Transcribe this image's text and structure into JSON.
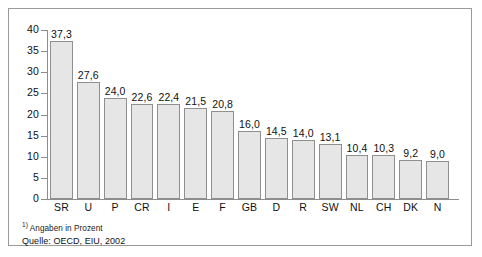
{
  "chart_data": {
    "type": "bar",
    "title": "",
    "xlabel": "",
    "ylabel": "",
    "ylim": [
      0,
      40
    ],
    "ytick_values": [
      40,
      35,
      30,
      25,
      20,
      15,
      10,
      5,
      0
    ],
    "ytick_labels": [
      "40",
      "35",
      "30",
      "25",
      "20",
      "15",
      "10",
      "5",
      "0"
    ],
    "grid": false,
    "legend": "none",
    "categories": [
      "SR",
      "U",
      "P",
      "CR",
      "I",
      "E",
      "F",
      "GB",
      "D",
      "R",
      "SW",
      "NL",
      "CH",
      "DK",
      "N"
    ],
    "values": [
      37.3,
      27.6,
      24.0,
      22.6,
      22.4,
      21.5,
      20.8,
      16.0,
      14.5,
      14.0,
      13.1,
      10.4,
      10.3,
      9.2,
      9.0
    ],
    "value_labels": [
      "37,3",
      "27,6",
      "24,0",
      "22,6",
      "22,4",
      "21,5",
      "20,8",
      "16,0",
      "14,5",
      "14,0",
      "13,1",
      "10,4",
      "10,3",
      "9,2",
      "9,0"
    ],
    "bar_fill_color": "#e6e6e6",
    "bar_border_color": "#8f8f8f",
    "axis_color": "#8d8d8d"
  },
  "footnotes": {
    "marker": "1)",
    "unit_note": "Angaben in Prozent",
    "source": "Quelle: OECD, EIU, 2002"
  }
}
